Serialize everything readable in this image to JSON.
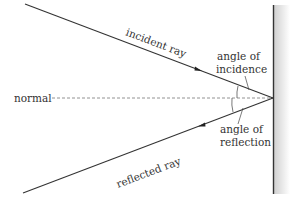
{
  "diagram": {
    "labels": {
      "incident_ray": "incident ray",
      "reflected_ray": "reflected ray",
      "normal": "normal",
      "angle_incidence_line1": "angle of",
      "angle_incidence_line2": "incidence",
      "angle_reflection_line1": "angle of",
      "angle_reflection_line2": "reflection"
    },
    "colors": {
      "ray": "#333333",
      "normal": "#666666",
      "mirror": "#333333",
      "mirror_shade": "#d8d8d8"
    }
  }
}
